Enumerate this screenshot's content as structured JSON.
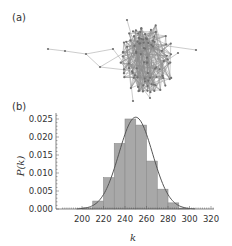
{
  "panels": {
    "a": {
      "label": "(a)",
      "description": "random network graph"
    },
    "b": {
      "label": "(b)"
    }
  },
  "colors": {
    "bar_fill": "#a8a8a8",
    "bar_fill_light": "#cfcfcf",
    "bar_stroke": "#8a8a8a",
    "curve": "#555555",
    "axis": "#555555",
    "network_edge": "#8c8c8c",
    "network_node": "#6e6e6e"
  },
  "chart_data": {
    "type": "bar",
    "title": "",
    "xlabel": "k",
    "ylabel": "P(k)",
    "bin_width": 10,
    "categories": [
      "200-210",
      "210-220",
      "220-230",
      "230-240",
      "240-250",
      "250-260",
      "260-270",
      "270-280",
      "280-290",
      "290-300"
    ],
    "bin_starts": [
      200,
      210,
      220,
      230,
      240,
      250,
      260,
      270,
      280,
      290
    ],
    "values": [
      0.0003,
      0.0022,
      0.0087,
      0.0182,
      0.025,
      0.0233,
      0.0133,
      0.0055,
      0.0017,
      0.0002
    ],
    "fit_curve": {
      "type": "gaussian",
      "mean": 250,
      "sigma": 15.6,
      "peak": 0.0255
    },
    "xlim": [
      182,
      322
    ],
    "ylim": [
      0,
      0.027
    ],
    "xticks": [
      "200",
      "220",
      "240",
      "260",
      "280",
      "300",
      "320"
    ],
    "xtick_values": [
      200,
      220,
      240,
      260,
      280,
      300,
      320
    ],
    "yticks": [
      "0.000",
      "0.005",
      "0.010",
      "0.015",
      "0.020",
      "0.025"
    ],
    "ytick_values": [
      0.0,
      0.005,
      0.01,
      0.015,
      0.02,
      0.025
    ],
    "grid": false,
    "legend": null
  }
}
